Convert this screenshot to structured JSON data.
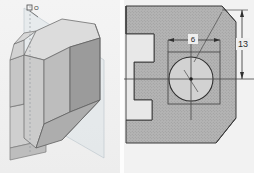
{
  "figure": {
    "panel_count": 2
  },
  "panel_3d": {
    "name": "isometric-solid-view",
    "label": "O",
    "background_color": "#f0f0f0",
    "face_colors": {
      "top": "#d5d5d5",
      "front_left": "#cbcbcb",
      "front_right": "#9a9a9a",
      "chamfer": "#bcbcbc",
      "ghost_plane": "#e2e6ea",
      "shelf": "#c4c4c4"
    },
    "edge_color": "#6e6e6e"
  },
  "panel_ortho": {
    "name": "section-orthographic-view",
    "background_color": "#efefef",
    "hatch_color": "#a0a0a0",
    "solid_fill": "#b0b0b0",
    "line_color": "#3a3a3a",
    "centerline_color": "#444444",
    "dimensions": [
      {
        "id": "hole-diameter",
        "label": "6",
        "orientation": "horizontal",
        "value": 6
      },
      {
        "id": "vertical-offset",
        "label": "13",
        "orientation": "vertical",
        "value": 13
      }
    ],
    "features": {
      "circle_name": "through-hole",
      "square_name": "counterbore-boundary",
      "center_mark": "hole-center-point",
      "chamfer_top_right": "corner-chamfer",
      "chamfer_bottom_right": "lower-corner-chamfer",
      "step_profile": "stepped-left-profile"
    }
  }
}
